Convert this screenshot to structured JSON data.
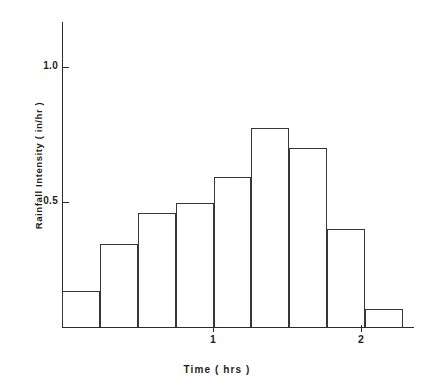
{
  "chart_data": {
    "type": "bar",
    "title": "",
    "subtitle": "",
    "xlabel": "Time ( hrs )",
    "ylabel": "Rainfall Intensity  ( in/hr )",
    "xlim": [
      0,
      2.32
    ],
    "ylim": [
      0,
      1.2
    ],
    "grid": false,
    "legend": null,
    "bar_kind": "hyetograph",
    "bin_width": 0.25,
    "x_edges": [
      0,
      0.25,
      0.5,
      0.75,
      1.0,
      1.25,
      1.5,
      1.75,
      2.0,
      2.25
    ],
    "categories": [
      "0-0.25",
      "0.25-0.5",
      "0.5-0.75",
      "0.75-1.0",
      "1.0-1.25",
      "1.25-1.5",
      "1.5-1.75",
      "1.75-2.0",
      "2.0-2.25"
    ],
    "values": [
      0.14,
      0.32,
      0.44,
      0.48,
      0.58,
      0.77,
      0.69,
      0.38,
      0.07
    ],
    "xticks": [
      {
        "value": 1,
        "label": "1"
      },
      {
        "value": 2,
        "label": "2"
      }
    ],
    "yticks": [
      {
        "value": 0.5,
        "label": "0.5"
      },
      {
        "value": 1.0,
        "label": "1.0"
      }
    ],
    "colors": {
      "axis": "#2e2a2b",
      "bar_edge": "#3a3637",
      "bar_fill": "none",
      "text": "#231f20",
      "background": "#ffffff"
    }
  },
  "axis_titles": {
    "y": "Rainfall Intensity  ( in/hr )",
    "x": "Time ( hrs )"
  }
}
